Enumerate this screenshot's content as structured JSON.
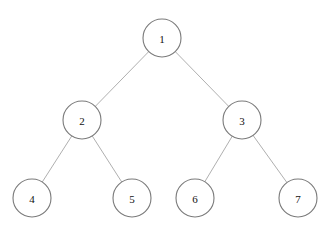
{
  "diagram": {
    "type": "binary-tree",
    "nodes": [
      {
        "id": "1",
        "label": "1",
        "x": 162,
        "y": 38
      },
      {
        "id": "2",
        "label": "2",
        "x": 82,
        "y": 120
      },
      {
        "id": "3",
        "label": "3",
        "x": 242,
        "y": 120
      },
      {
        "id": "4",
        "label": "4",
        "x": 32,
        "y": 198
      },
      {
        "id": "5",
        "label": "5",
        "x": 132,
        "y": 198
      },
      {
        "id": "6",
        "label": "6",
        "x": 195,
        "y": 198
      },
      {
        "id": "7",
        "label": "7",
        "x": 298,
        "y": 198
      }
    ],
    "edges": [
      {
        "from": "1",
        "to": "2"
      },
      {
        "from": "1",
        "to": "3"
      },
      {
        "from": "2",
        "to": "4"
      },
      {
        "from": "2",
        "to": "5"
      },
      {
        "from": "3",
        "to": "6"
      },
      {
        "from": "3",
        "to": "7"
      }
    ],
    "node_radius": 19
  }
}
